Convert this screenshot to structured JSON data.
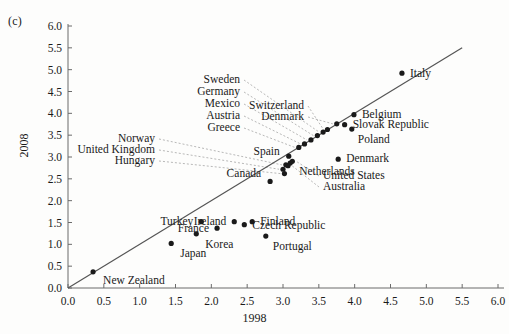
{
  "figure": {
    "panel_tag": "(c)",
    "axis_title_x": "1998",
    "axis_title_y": "2008"
  },
  "chart_data": {
    "type": "scatter",
    "title": "",
    "subtitle": "",
    "xlabel": "1998",
    "ylabel": "2008",
    "xlim": [
      0.0,
      6.0
    ],
    "ylim": [
      0.0,
      6.0
    ],
    "grid": false,
    "legend": "none",
    "xticks": [
      "0.0",
      "0.5",
      "1.0",
      "1.5",
      "2.0",
      "2.5",
      "3.0",
      "3.5",
      "4.0",
      "4.5",
      "5.0",
      "5.5",
      "6.0"
    ],
    "yticks": [
      "0.0",
      "0.5",
      "1.0",
      "1.5",
      "2.0",
      "2.5",
      "3.0",
      "3.5",
      "4.0",
      "4.5",
      "5.0",
      "5.5",
      "6.0"
    ],
    "xtick_values": [
      0.0,
      0.5,
      1.0,
      1.5,
      2.0,
      2.5,
      3.0,
      3.5,
      4.0,
      4.5,
      5.0,
      5.5,
      6.0
    ],
    "ytick_values": [
      0.0,
      0.5,
      1.0,
      1.5,
      2.0,
      2.5,
      3.0,
      3.5,
      4.0,
      4.5,
      5.0,
      5.5,
      6.0
    ],
    "reference_line": {
      "name": "45-degree-line",
      "from": [
        0.0,
        0.0
      ],
      "to": [
        5.5,
        5.5
      ],
      "color": "#555555"
    },
    "marker_color": "#1a1a1a",
    "points": [
      {
        "label": "New Zealand",
        "x": 0.35,
        "y": 0.37,
        "label_dx": 10,
        "label_dy": 9,
        "anchor": "start",
        "leader": false
      },
      {
        "label": "Japan",
        "x": 1.44,
        "y": 1.02,
        "label_dx": 9,
        "label_dy": 11,
        "anchor": "start",
        "leader": false
      },
      {
        "label": "Korea",
        "x": 1.79,
        "y": 1.24,
        "label_dx": 9,
        "label_dy": 11,
        "anchor": "start",
        "leader": false
      },
      {
        "label": "Turkey",
        "x": 1.86,
        "y": 1.52,
        "label_dx": -8,
        "label_dy": 0,
        "anchor": "end",
        "leader": false
      },
      {
        "label": "France",
        "x": 2.08,
        "y": 1.37,
        "label_dx": -8,
        "label_dy": 1,
        "anchor": "end",
        "leader": false
      },
      {
        "label": "Ireland",
        "x": 2.32,
        "y": 1.52,
        "label_dx": -8,
        "label_dy": 0,
        "anchor": "end",
        "leader": false
      },
      {
        "label": "Czech Republic",
        "x": 2.46,
        "y": 1.45,
        "label_dx": 8,
        "label_dy": 1,
        "anchor": "start",
        "leader": false
      },
      {
        "label": "Finland",
        "x": 2.57,
        "y": 1.52,
        "label_dx": 8,
        "label_dy": 0,
        "anchor": "start",
        "leader": false
      },
      {
        "label": "Portugal",
        "x": 2.76,
        "y": 1.19,
        "label_dx": 7,
        "label_dy": 11,
        "anchor": "start",
        "leader": false
      },
      {
        "label": "Canada",
        "x": 2.82,
        "y": 2.44,
        "label_dx": -9,
        "label_dy": -7,
        "anchor": "end",
        "leader": false
      },
      {
        "label": "Hungary",
        "x": 3.02,
        "y": 2.62,
        "label_dx": 0,
        "label_dy": 0,
        "anchor": "end",
        "leader": true,
        "lx": 155,
        "ly": 161
      },
      {
        "label": "United Kingdom",
        "x": 3.0,
        "y": 2.72,
        "label_dx": 0,
        "label_dy": 0,
        "anchor": "end",
        "leader": true,
        "lx": 155,
        "ly": 150
      },
      {
        "label": "Norway",
        "x": 3.04,
        "y": 2.82,
        "label_dx": 0,
        "label_dy": 0,
        "anchor": "end",
        "leader": true,
        "lx": 155,
        "ly": 139
      },
      {
        "label": "Netherlands",
        "x": 3.1,
        "y": 2.86,
        "label_dx": 9,
        "label_dy": 9,
        "anchor": "start",
        "leader": false
      },
      {
        "label": "United States",
        "x": 3.13,
        "y": 2.9,
        "label_dx": 0,
        "label_dy": 0,
        "anchor": "start",
        "leader": true,
        "lx": 323,
        "ly": 176
      },
      {
        "label": "Australia",
        "x": 3.07,
        "y": 2.8,
        "label_dx": 0,
        "label_dy": 0,
        "anchor": "start",
        "leader": true,
        "lx": 323,
        "ly": 187
      },
      {
        "label": "Spain",
        "x": 3.08,
        "y": 3.02,
        "label_dx": -9,
        "label_dy": -4,
        "anchor": "end",
        "leader": false
      },
      {
        "label": "Greece",
        "x": 3.22,
        "y": 3.22,
        "label_dx": 0,
        "label_dy": 0,
        "anchor": "end",
        "leader": true,
        "lx": 240,
        "ly": 128
      },
      {
        "label": "Austria",
        "x": 3.3,
        "y": 3.3,
        "label_dx": 0,
        "label_dy": 0,
        "anchor": "end",
        "leader": true,
        "lx": 240,
        "ly": 116
      },
      {
        "label": "Mexico",
        "x": 3.39,
        "y": 3.39,
        "label_dx": 0,
        "label_dy": 0,
        "anchor": "end",
        "leader": true,
        "lx": 240,
        "ly": 104
      },
      {
        "label": "Germany",
        "x": 3.48,
        "y": 3.49,
        "label_dx": 0,
        "label_dy": 0,
        "anchor": "end",
        "leader": true,
        "lx": 240,
        "ly": 92
      },
      {
        "label": "Sweden",
        "x": 3.56,
        "y": 3.57,
        "label_dx": 0,
        "label_dy": 0,
        "anchor": "end",
        "leader": true,
        "lx": 240,
        "ly": 80
      },
      {
        "label": "Switzerland",
        "x": 3.62,
        "y": 3.63,
        "label_dx": 0,
        "label_dy": 0,
        "anchor": "end",
        "leader": true,
        "lx": 304,
        "ly": 106
      },
      {
        "label": "Denmark",
        "x": 3.75,
        "y": 3.76,
        "label_dx": 0,
        "label_dy": 0,
        "anchor": "end",
        "leader": true,
        "lx": 304,
        "ly": 117
      },
      {
        "label": "Slovak Republic",
        "x": 3.86,
        "y": 3.74,
        "label_dx": 8,
        "label_dy": 0,
        "anchor": "start",
        "leader": false
      },
      {
        "label": "Belgium",
        "x": 3.99,
        "y": 3.97,
        "label_dx": 8,
        "label_dy": 0,
        "anchor": "start",
        "leader": false
      },
      {
        "label": "Poland",
        "x": 3.96,
        "y": 3.64,
        "label_dx": 6,
        "label_dy": 11,
        "anchor": "start",
        "leader": false
      },
      {
        "label": "Denmark",
        "x": 3.77,
        "y": 2.95,
        "label_dx": 8,
        "label_dy": 0,
        "anchor": "start",
        "leader": false
      },
      {
        "label": "Italy",
        "x": 4.66,
        "y": 4.92,
        "label_dx": 8,
        "label_dy": 1,
        "anchor": "start",
        "leader": false
      }
    ]
  }
}
